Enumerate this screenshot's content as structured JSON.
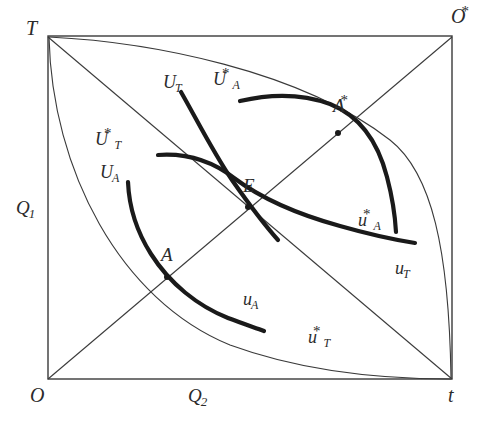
{
  "figure": {
    "type": "edgeworth-box-diagram",
    "width": 486,
    "height": 428,
    "background": "#ffffff",
    "line_color": "#3a3a3a",
    "thick_curve_color": "#1a1a1a",
    "thin_line_width": 1.1,
    "thick_line_width": 4.2
  },
  "box": {
    "left": 48,
    "top": 36,
    "right": 452,
    "bottom": 379
  },
  "corners": {
    "origin_bottom_left": {
      "base": "O",
      "sup": "",
      "sub": "",
      "x": 30,
      "y": 385
    },
    "origin_top_left": {
      "base": "T",
      "sup": "",
      "sub": "",
      "x": 26,
      "y": 18
    },
    "origin_top_right": {
      "base": "O",
      "sup": "*",
      "sub": "",
      "x": 451,
      "y": 6
    },
    "origin_bottom_right": {
      "base": "t",
      "sup": "",
      "sub": "",
      "x": 448,
      "y": 385
    }
  },
  "axes": {
    "vertical_label": {
      "base": "Q",
      "sub": "1",
      "sup": "",
      "x": 16,
      "y": 198
    },
    "horizontal_label": {
      "base": "Q",
      "sub": "2",
      "sup": "",
      "x": 188,
      "y": 386
    }
  },
  "points": [
    {
      "name": "E",
      "base": "E",
      "sub": "",
      "sup": "",
      "px": 248,
      "py": 207,
      "label_x": 243,
      "label_y": 176
    },
    {
      "name": "A",
      "base": "A",
      "sub": "",
      "sup": "",
      "px": 167,
      "py": 277,
      "label_x": 161,
      "label_y": 245
    },
    {
      "name": "A-star",
      "base": "A",
      "sub": "",
      "sup": "*",
      "px": 338,
      "py": 133,
      "label_x": 333,
      "label_y": 96
    }
  ],
  "curve_labels": [
    {
      "name": "U_T",
      "base": "U",
      "sub": "T",
      "sup": "",
      "x": 163,
      "y": 73
    },
    {
      "name": "U_A_star",
      "base": "U",
      "sub": "A",
      "sup": "*",
      "x": 213,
      "y": 70
    },
    {
      "name": "U_T_star",
      "base": "U",
      "sub": "T",
      "sup": "*",
      "x": 95,
      "y": 130
    },
    {
      "name": "U_A",
      "base": "U",
      "sub": "A",
      "sup": "",
      "x": 100,
      "y": 163
    },
    {
      "name": "u_A_star",
      "base": "u",
      "sub": "A",
      "sup": "*",
      "x": 358,
      "y": 211
    },
    {
      "name": "u_T",
      "base": "u",
      "sub": "T",
      "sup": "",
      "x": 395,
      "y": 259
    },
    {
      "name": "u_A",
      "base": "u",
      "sub": "A",
      "sup": "",
      "x": 243,
      "y": 290
    },
    {
      "name": "u_T_star",
      "base": "u",
      "sub": "T",
      "sup": "*",
      "x": 308,
      "y": 328
    }
  ],
  "geometry": {
    "diagonals": [
      {
        "name": "diagonal-O-to-Ostar",
        "x1": 48,
        "y1": 379,
        "x2": 452,
        "y2": 37
      },
      {
        "name": "diagonal-T-to-t",
        "x1": 48,
        "y1": 37,
        "x2": 452,
        "y2": 379
      }
    ],
    "thin_contract_curves": [
      {
        "name": "contract-curve-T-to-t",
        "d": "M 49 37 C 52 170 120 300 230 345 C 320 378 420 379 451 379"
      },
      {
        "name": "contract-curve-T-to-Ostar-upper",
        "d": "M 49 37 C 150 42 300 70 390 140 C 432 173 449 250 451 378"
      }
    ],
    "thick_indifference_curves": [
      {
        "name": "curve-U_T",
        "d": "M 181 92 C 197 120 213 152 232 180 C 246 200 262 222 278 240"
      },
      {
        "name": "curve-U_A_star",
        "d": "M 240 101 C 270 94 300 93 330 104 C 360 116 378 142 387 177 C 392 196 395 214 396 232"
      },
      {
        "name": "curve-U_T_star",
        "d": "M 158 155 C 186 153 212 161 234 178 C 262 199 300 215 340 226 C 368 234 396 240 415 243"
      },
      {
        "name": "curve-U_A",
        "d": "M 128 182 C 129 206 137 232 151 254 C 170 284 198 306 228 318 C 244 324 256 328 264 331"
      }
    ]
  }
}
